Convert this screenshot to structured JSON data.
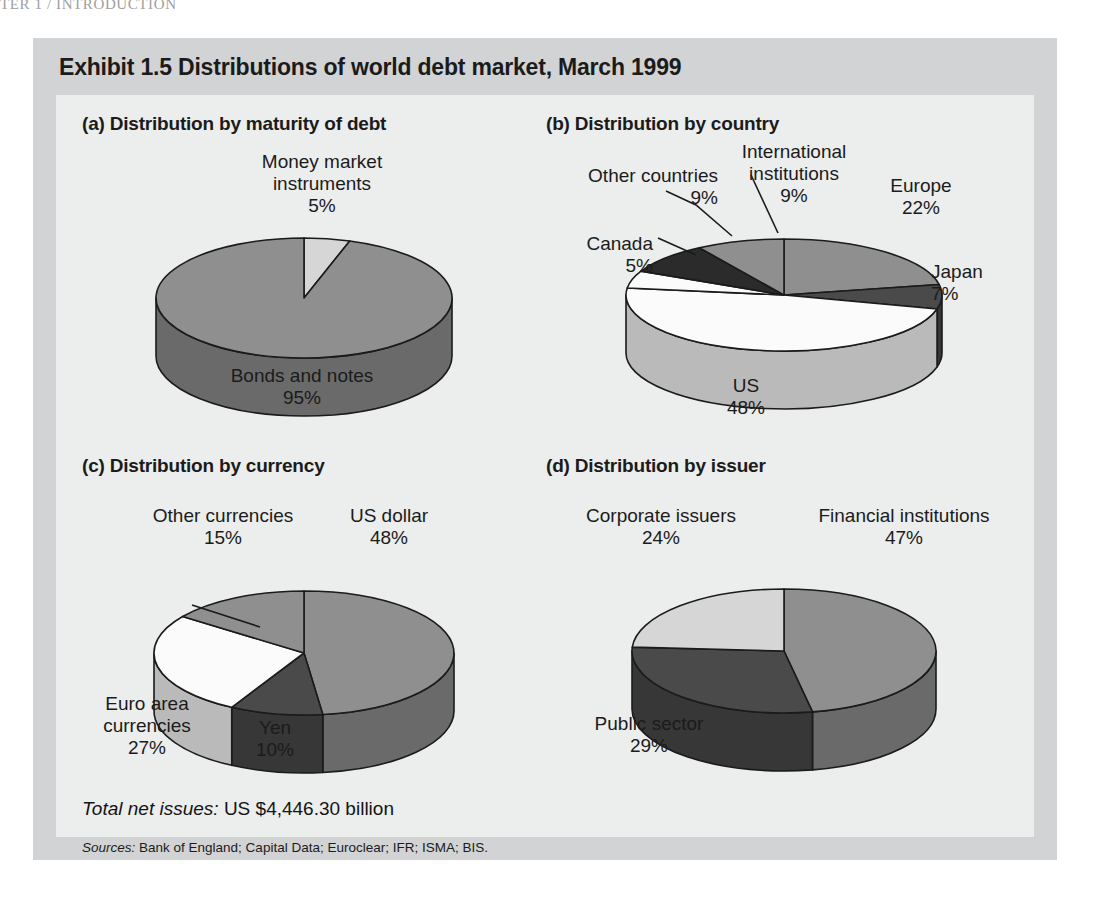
{
  "page": {
    "running_header": "TER 1 / INTRODUCTION"
  },
  "exhibit": {
    "title": "Exhibit 1.5  Distributions of world debt market, March 1999",
    "total_label": "Total net issues:",
    "total_value": "US $4,446.30 billion",
    "sources_label": "Sources:",
    "sources_value": "Bank of England; Capital Data; Euroclear; IFR; ISMA; BIS."
  },
  "colors": {
    "panel_outer": "#d2d3d4",
    "panel_inner": "#eceded",
    "slice_light": "#fbfbfb",
    "slice_midlight": "#d6d6d6",
    "slice_mid": "#8f8f8f",
    "slice_dark": "#4a4a4a",
    "slice_darkest": "#2b2b2b",
    "outline": "#1b1b1b",
    "text": "#1b1b1b"
  },
  "chart_data": [
    {
      "id": "a",
      "type": "pie",
      "title": "(a) Distribution by maturity of debt",
      "unit": "%",
      "categories": [
        "Money market instruments",
        "Bonds and notes"
      ],
      "values": [
        5,
        95
      ],
      "labels": [
        {
          "text": "Money market\ninstruments\n5%",
          "name": "money-market-instruments"
        },
        {
          "text": "Bonds and notes\n95%",
          "name": "bonds-and-notes"
        }
      ]
    },
    {
      "id": "b",
      "type": "pie",
      "title": "(b) Distribution by country",
      "unit": "%",
      "categories": [
        "Europe",
        "Japan",
        "US",
        "Canada",
        "Other countries",
        "International institutions"
      ],
      "values": [
        22,
        7,
        48,
        5,
        9,
        9
      ],
      "labels": [
        {
          "text": "Europe\n22%",
          "name": "europe"
        },
        {
          "text": "Japan\n7%",
          "name": "japan"
        },
        {
          "text": "US\n48%",
          "name": "us"
        },
        {
          "text": "Canada\n5%",
          "name": "canada"
        },
        {
          "text": "Other countries\n9%",
          "name": "other-countries"
        },
        {
          "text": "International\ninstitutions\n9%",
          "name": "international-institutions"
        }
      ]
    },
    {
      "id": "c",
      "type": "pie",
      "title": "(c) Distribution by currency",
      "unit": "%",
      "categories": [
        "US dollar",
        "Yen",
        "Euro area currencies",
        "Other currencies"
      ],
      "values": [
        48,
        10,
        27,
        15
      ],
      "labels": [
        {
          "text": "US dollar\n48%",
          "name": "us-dollar"
        },
        {
          "text": "Yen\n10%",
          "name": "yen"
        },
        {
          "text": "Euro area\ncurrencies\n27%",
          "name": "euro-area-currencies"
        },
        {
          "text": "Other currencies\n15%",
          "name": "other-currencies"
        }
      ]
    },
    {
      "id": "d",
      "type": "pie",
      "title": "(d) Distribution by issuer",
      "unit": "%",
      "categories": [
        "Financial institutions",
        "Public sector",
        "Corporate issuers"
      ],
      "values": [
        47,
        29,
        24
      ],
      "labels": [
        {
          "text": "Financial institutions\n47%",
          "name": "financial-institutions"
        },
        {
          "text": "Public sector\n29%",
          "name": "public-sector"
        },
        {
          "text": "Corporate issuers\n24%",
          "name": "corporate-issuers"
        }
      ]
    }
  ]
}
